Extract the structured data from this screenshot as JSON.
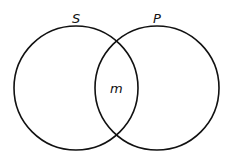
{
  "diagram": {
    "type": "venn",
    "sets": [
      {
        "label": "S",
        "cx": 76,
        "cy": 88,
        "r": 62
      },
      {
        "label": "P",
        "cx": 157,
        "cy": 88,
        "r": 62
      }
    ],
    "intersection_label": "m",
    "stroke_color": "#111111",
    "background": "#ffffff"
  }
}
